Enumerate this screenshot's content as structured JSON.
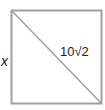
{
  "diagram": {
    "shape": "square",
    "side_label": "x",
    "diagonal_label": "10√2",
    "line_color": "#a0a0a0"
  }
}
